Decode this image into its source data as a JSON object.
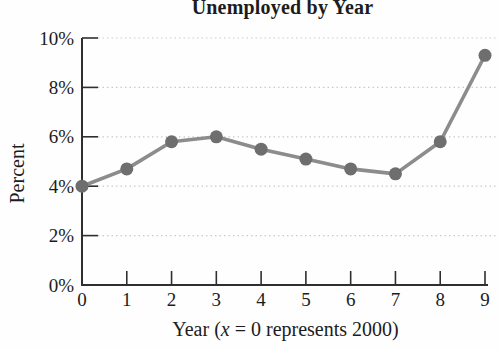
{
  "figure": {
    "title": "Unemployed by Year"
  },
  "chart_data": {
    "type": "line",
    "title": "Unemployed by Year",
    "xlabel": "Year (x = 0 represents 2000)",
    "xlabel_parts": {
      "prefix": "Year (",
      "var": "x",
      "suffix": " = 0 represents 2000)"
    },
    "ylabel": "Percent",
    "x": [
      0,
      1,
      2,
      3,
      4,
      5,
      6,
      7,
      8,
      9
    ],
    "values": [
      4.0,
      4.7,
      5.8,
      6.0,
      5.5,
      5.1,
      4.7,
      4.5,
      5.8,
      9.3
    ],
    "x_tick_labels": [
      "0",
      "1",
      "2",
      "3",
      "4",
      "5",
      "6",
      "7",
      "8",
      "9"
    ],
    "y_tick_labels": [
      "0%",
      "2%",
      "4%",
      "6%",
      "8%",
      "10%"
    ],
    "xlim": [
      0,
      9
    ],
    "ylim": [
      0,
      10
    ],
    "grid": "horizontal dotted gridlines at each 2% level",
    "legend": "none",
    "colors": {
      "line": "#8c8c8c",
      "point": "#6e6e6e",
      "grid": "#c9c9c9",
      "axis": "#2f2f2f",
      "text": "#1c1c1c",
      "background": "#fefefe"
    }
  }
}
